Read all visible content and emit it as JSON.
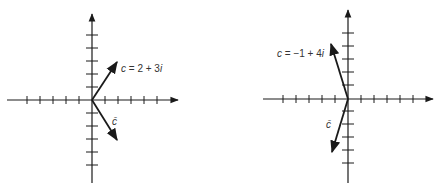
{
  "diagrams": [
    {
      "id": "left",
      "origin": [
        92,
        100
      ],
      "unit_px": 13,
      "x_ticks": [
        -5,
        -4,
        -3,
        -2,
        -1,
        1,
        2,
        3,
        4,
        5
      ],
      "y_ticks": [
        -5,
        -4,
        -3,
        -2,
        -1,
        1,
        2,
        3,
        4,
        5
      ],
      "vector": {
        "re": 2,
        "im": 3,
        "label_lhs": "c",
        "label_rhs": " = 2 + 3",
        "label_i": "i"
      },
      "conjugate": {
        "re": 2,
        "im": -3,
        "label": "c̄"
      }
    },
    {
      "id": "right",
      "origin": [
        348,
        99
      ],
      "unit_px": 13,
      "x_ticks": [
        -5,
        -4,
        -3,
        -2,
        -1,
        1,
        2,
        3,
        4,
        5
      ],
      "y_ticks": [
        -4,
        -3,
        -2,
        -1,
        1,
        2,
        3,
        4,
        5
      ],
      "vector": {
        "re": -1,
        "im": 4,
        "label_lhs": "c",
        "label_rhs": " = −1 + 4",
        "label_i": "i"
      },
      "conjugate": {
        "re": -1,
        "im": -4,
        "label": "c̄"
      }
    }
  ],
  "colors": {
    "ink": "#1a1a1a",
    "background": "#ffffff"
  }
}
